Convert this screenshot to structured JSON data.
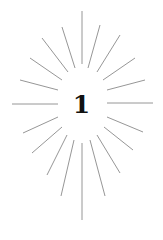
{
  "illustration": {
    "numeral": "1",
    "ray_color": "#8a8a8a",
    "numeral_color": "#111111",
    "background": "#ffffff",
    "rays": [
      [
        82,
        64,
        82,
        11
      ],
      [
        75,
        68,
        62,
        27
      ],
      [
        68,
        72,
        42,
        38
      ],
      [
        62,
        80,
        30,
        58
      ],
      [
        58,
        90,
        20,
        80
      ],
      [
        58,
        104,
        12,
        104
      ],
      [
        58,
        117,
        23,
        133
      ],
      [
        62,
        127,
        32,
        153
      ],
      [
        67,
        135,
        47,
        175
      ],
      [
        74,
        140,
        61,
        196
      ],
      [
        82,
        143,
        82,
        220
      ],
      [
        90,
        140,
        105,
        196
      ],
      [
        97,
        135,
        120,
        173
      ],
      [
        104,
        127,
        133,
        150
      ],
      [
        107,
        117,
        143,
        132
      ],
      [
        107,
        103,
        153,
        103
      ],
      [
        107,
        90,
        145,
        80
      ],
      [
        103,
        80,
        135,
        58
      ],
      [
        97,
        72,
        120,
        35
      ],
      [
        88,
        68,
        100,
        25
      ]
    ]
  }
}
